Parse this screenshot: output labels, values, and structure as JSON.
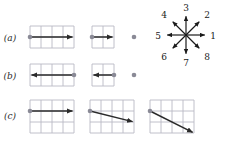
{
  "figure": {
    "background_color": "#ffffff",
    "grid_line_color": "#b9b9c4",
    "arrow_color": "#2b2b2b",
    "dot_color": "#8a8a96",
    "label_color": "#2b2b2b",
    "cell_size": 11
  },
  "rows": [
    {
      "label": "(a)",
      "label_x": 10,
      "label_y": 41,
      "panels": [
        {
          "name": "panel-a-1",
          "grid": {
            "x": 30,
            "y": 26,
            "cols": 4,
            "rows": 2
          },
          "dot": {
            "x": 30,
            "y": 37
          },
          "arrow": {
            "x1": 30,
            "y1": 37,
            "x2": 74,
            "y2": 37
          },
          "direction_number": 1,
          "magnitude_cells": 4
        },
        {
          "name": "panel-a-2",
          "grid": {
            "x": 92,
            "y": 26,
            "cols": 2,
            "rows": 2
          },
          "dot": {
            "x": 92,
            "y": 37
          },
          "arrow": {
            "x1": 92,
            "y1": 37,
            "x2": 114,
            "y2": 37
          },
          "direction_number": 1,
          "magnitude_cells": 2
        },
        {
          "name": "panel-a-3",
          "grid": null,
          "dot": {
            "x": 134,
            "y": 37
          },
          "arrow": null,
          "direction_number": 0,
          "magnitude_cells": 0
        }
      ]
    },
    {
      "label": "(b)",
      "label_x": 10,
      "label_y": 79,
      "panels": [
        {
          "name": "panel-b-1",
          "grid": {
            "x": 30,
            "y": 64,
            "cols": 4,
            "rows": 2
          },
          "dot": {
            "x": 74,
            "y": 75
          },
          "arrow": {
            "x1": 74,
            "y1": 75,
            "x2": 30,
            "y2": 75
          },
          "direction_number": 5,
          "magnitude_cells": 4
        },
        {
          "name": "panel-b-2",
          "grid": {
            "x": 92,
            "y": 64,
            "cols": 2,
            "rows": 2
          },
          "dot": {
            "x": 114,
            "y": 75
          },
          "arrow": {
            "x1": 114,
            "y1": 75,
            "x2": 92,
            "y2": 75
          },
          "direction_number": 5,
          "magnitude_cells": 2
        },
        {
          "name": "panel-b-3",
          "grid": null,
          "dot": {
            "x": 134,
            "y": 75
          },
          "arrow": null,
          "direction_number": 0,
          "magnitude_cells": 0
        }
      ]
    },
    {
      "label": "(c)",
      "label_x": 10,
      "label_y": 119,
      "panels": [
        {
          "name": "panel-c-1",
          "grid": {
            "x": 30,
            "y": 100,
            "cols": 4,
            "rows": 3
          },
          "dot": {
            "x": 30,
            "y": 111
          },
          "arrow": {
            "x1": 30,
            "y1": 111,
            "x2": 74,
            "y2": 111
          },
          "direction_number": 1,
          "magnitude_cells": 4
        },
        {
          "name": "panel-c-2",
          "grid": {
            "x": 90,
            "y": 100,
            "cols": 4,
            "rows": 3
          },
          "dot": {
            "x": 90,
            "y": 111
          },
          "arrow": {
            "x1": 90,
            "y1": 111,
            "x2": 134,
            "y2": 122
          },
          "direction_number": 8,
          "magnitude_cells": 4
        },
        {
          "name": "panel-c-3",
          "grid": {
            "x": 150,
            "y": 100,
            "cols": 4,
            "rows": 3
          },
          "dot": {
            "x": 150,
            "y": 111
          },
          "arrow": {
            "x1": 150,
            "y1": 111,
            "x2": 194,
            "y2": 133
          },
          "direction_number": 8,
          "magnitude_cells": 4
        }
      ]
    }
  ],
  "compass": {
    "name": "direction-key",
    "center": {
      "x": 186,
      "y": 35
    },
    "arrow_length": 20,
    "directions": [
      {
        "number": "1",
        "angle_deg": 0,
        "label_x": 213,
        "label_y": 39
      },
      {
        "number": "2",
        "angle_deg": 45,
        "label_x": 207,
        "label_y": 18
      },
      {
        "number": "3",
        "angle_deg": 90,
        "label_x": 186,
        "label_y": 11
      },
      {
        "number": "4",
        "angle_deg": 135,
        "label_x": 164,
        "label_y": 18
      },
      {
        "number": "5",
        "angle_deg": 180,
        "label_x": 158,
        "label_y": 39
      },
      {
        "number": "6",
        "angle_deg": 225,
        "label_x": 164,
        "label_y": 60
      },
      {
        "number": "7",
        "angle_deg": 270,
        "label_x": 186,
        "label_y": 66
      },
      {
        "number": "8",
        "angle_deg": 315,
        "label_x": 207,
        "label_y": 60
      }
    ]
  }
}
